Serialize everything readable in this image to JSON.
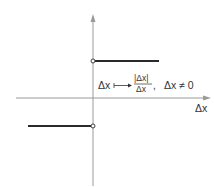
{
  "diagram": {
    "type": "function-graph",
    "axes": {
      "x_label": "Δx",
      "x_axis_color": "#9a9a9a",
      "y_axis_color": "#9a9a9a"
    },
    "formula": {
      "lhs": "Δx",
      "maps_to": "⟼",
      "numerator": "|Δx|",
      "denominator": "Δx",
      "separator": ",",
      "condition": "Δx ≠ 0"
    },
    "segments": [
      {
        "name": "positive-branch",
        "y_value": 1,
        "x_range": "(0, ∞)",
        "open_endpoint": "left"
      },
      {
        "name": "negative-branch",
        "y_value": -1,
        "x_range": "(-∞, 0)",
        "open_endpoint": "right"
      }
    ],
    "colors": {
      "segment": "#2a2a2a",
      "axis": "#9a9a9a",
      "text": "#333333",
      "background": "#ffffff"
    }
  }
}
